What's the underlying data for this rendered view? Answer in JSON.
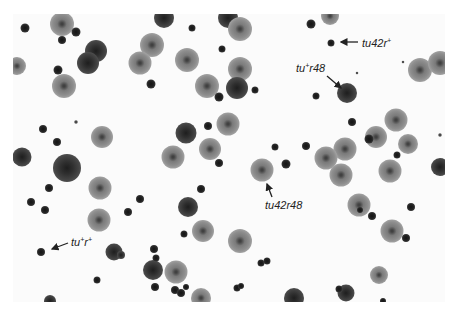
{
  "figure": {
    "labels": [
      {
        "id": "tu42r_plus",
        "base": "tu42r",
        "sup": "+",
        "tail": ""
      },
      {
        "id": "tu_plus_r48",
        "base": "tu",
        "sup": "+",
        "tail": "r48"
      },
      {
        "id": "tu42r48",
        "base": "tu42r48",
        "sup": "",
        "tail": ""
      },
      {
        "id": "tu_plus_r_plus",
        "base": "tu",
        "sup": "+",
        "tail": "r",
        "sup2": "+"
      }
    ]
  },
  "plaques": [
    {
      "x": 62,
      "y": 24,
      "d": 24,
      "t": "r"
    },
    {
      "x": 25,
      "y": 28,
      "d": 9,
      "t": "small"
    },
    {
      "x": 76,
      "y": 32,
      "d": 9,
      "t": "small"
    },
    {
      "x": 62,
      "y": 40,
      "d": 8,
      "t": "small"
    },
    {
      "x": 96,
      "y": 51,
      "d": 22,
      "t": "dark"
    },
    {
      "x": 88,
      "y": 63,
      "d": 22,
      "t": "dark"
    },
    {
      "x": 17,
      "y": 66,
      "d": 18,
      "t": "r"
    },
    {
      "x": 58,
      "y": 70,
      "d": 9,
      "t": "small"
    },
    {
      "x": 64,
      "y": 86,
      "d": 24,
      "t": "r"
    },
    {
      "x": 164,
      "y": 18,
      "d": 20,
      "t": "dark"
    },
    {
      "x": 192,
      "y": 28,
      "d": 7,
      "t": "small"
    },
    {
      "x": 228,
      "y": 18,
      "d": 20,
      "t": "dark"
    },
    {
      "x": 152,
      "y": 45,
      "d": 24,
      "t": "r"
    },
    {
      "x": 140,
      "y": 63,
      "d": 23,
      "t": "r"
    },
    {
      "x": 222,
      "y": 49,
      "d": 7,
      "t": "small"
    },
    {
      "x": 187,
      "y": 60,
      "d": 24,
      "t": "r"
    },
    {
      "x": 240,
      "y": 29,
      "d": 24,
      "t": "r"
    },
    {
      "x": 240,
      "y": 69,
      "d": 24,
      "t": "r"
    },
    {
      "x": 151,
      "y": 84,
      "d": 9,
      "t": "small"
    },
    {
      "x": 207,
      "y": 86,
      "d": 24,
      "t": "r"
    },
    {
      "x": 237,
      "y": 88,
      "d": 22,
      "t": "dark"
    },
    {
      "x": 219,
      "y": 97,
      "d": 9,
      "t": "small"
    },
    {
      "x": 255,
      "y": 90,
      "d": 7,
      "t": "small"
    },
    {
      "x": 311,
      "y": 24,
      "d": 9,
      "t": "small"
    },
    {
      "x": 330,
      "y": 16,
      "d": 18,
      "t": "r"
    },
    {
      "x": 331,
      "y": 43,
      "d": 7,
      "t": "small"
    },
    {
      "x": 347,
      "y": 93,
      "d": 20,
      "t": "dark"
    },
    {
      "x": 316,
      "y": 96,
      "d": 7,
      "t": "small"
    },
    {
      "x": 357,
      "y": 73,
      "d": 3,
      "t": "tiny"
    },
    {
      "x": 420,
      "y": 70,
      "d": 24,
      "t": "r"
    },
    {
      "x": 440,
      "y": 63,
      "d": 24,
      "t": "r"
    },
    {
      "x": 403,
      "y": 62,
      "d": 3,
      "t": "tiny"
    },
    {
      "x": 43,
      "y": 129,
      "d": 8,
      "t": "small"
    },
    {
      "x": 57,
      "y": 142,
      "d": 8,
      "t": "small"
    },
    {
      "x": 76,
      "y": 122,
      "d": 4,
      "t": "tiny"
    },
    {
      "x": 102,
      "y": 137,
      "d": 22,
      "t": "r"
    },
    {
      "x": 22,
      "y": 157,
      "d": 19,
      "t": "dark"
    },
    {
      "x": 67,
      "y": 168,
      "d": 28,
      "t": "dark"
    },
    {
      "x": 49,
      "y": 188,
      "d": 8,
      "t": "small"
    },
    {
      "x": 100,
      "y": 188,
      "d": 23,
      "t": "r"
    },
    {
      "x": 31,
      "y": 202,
      "d": 8,
      "t": "small"
    },
    {
      "x": 140,
      "y": 199,
      "d": 8,
      "t": "small"
    },
    {
      "x": 186,
      "y": 133,
      "d": 21,
      "t": "dark"
    },
    {
      "x": 208,
      "y": 126,
      "d": 8,
      "t": "small"
    },
    {
      "x": 228,
      "y": 124,
      "d": 23,
      "t": "r"
    },
    {
      "x": 210,
      "y": 149,
      "d": 22,
      "t": "r"
    },
    {
      "x": 173,
      "y": 157,
      "d": 23,
      "t": "r"
    },
    {
      "x": 219,
      "y": 163,
      "d": 8,
      "t": "small"
    },
    {
      "x": 262,
      "y": 170,
      "d": 23,
      "t": "r"
    },
    {
      "x": 275,
      "y": 147,
      "d": 7,
      "t": "small"
    },
    {
      "x": 286,
      "y": 164,
      "d": 9,
      "t": "small"
    },
    {
      "x": 306,
      "y": 146,
      "d": 8,
      "t": "small"
    },
    {
      "x": 201,
      "y": 189,
      "d": 8,
      "t": "small"
    },
    {
      "x": 188,
      "y": 207,
      "d": 20,
      "t": "dark"
    },
    {
      "x": 352,
      "y": 122,
      "d": 8,
      "t": "small"
    },
    {
      "x": 396,
      "y": 120,
      "d": 23,
      "t": "r"
    },
    {
      "x": 376,
      "y": 137,
      "d": 22,
      "t": "r"
    },
    {
      "x": 369,
      "y": 139,
      "d": 9,
      "t": "small"
    },
    {
      "x": 345,
      "y": 149,
      "d": 23,
      "t": "r"
    },
    {
      "x": 326,
      "y": 158,
      "d": 23,
      "t": "r"
    },
    {
      "x": 408,
      "y": 144,
      "d": 20,
      "t": "r"
    },
    {
      "x": 440,
      "y": 135,
      "d": 4,
      "t": "tiny"
    },
    {
      "x": 397,
      "y": 155,
      "d": 7,
      "t": "small"
    },
    {
      "x": 341,
      "y": 175,
      "d": 23,
      "t": "r"
    },
    {
      "x": 440,
      "y": 167,
      "d": 18,
      "t": "dark"
    },
    {
      "x": 390,
      "y": 171,
      "d": 23,
      "t": "r"
    },
    {
      "x": 359,
      "y": 205,
      "d": 23,
      "t": "r"
    },
    {
      "x": 411,
      "y": 207,
      "d": 8,
      "t": "small"
    },
    {
      "x": 360,
      "y": 210,
      "d": 6,
      "t": "small"
    },
    {
      "x": 372,
      "y": 216,
      "d": 8,
      "t": "small"
    },
    {
      "x": 392,
      "y": 231,
      "d": 23,
      "t": "r"
    },
    {
      "x": 406,
      "y": 238,
      "d": 8,
      "t": "small"
    },
    {
      "x": 45,
      "y": 210,
      "d": 8,
      "t": "small"
    },
    {
      "x": 99,
      "y": 220,
      "d": 23,
      "t": "r"
    },
    {
      "x": 128,
      "y": 212,
      "d": 8,
      "t": "small"
    },
    {
      "x": 41,
      "y": 252,
      "d": 8,
      "t": "small"
    },
    {
      "x": 114,
      "y": 252,
      "d": 17,
      "t": "dark"
    },
    {
      "x": 121,
      "y": 255,
      "d": 8,
      "t": "dark"
    },
    {
      "x": 154,
      "y": 249,
      "d": 8,
      "t": "small"
    },
    {
      "x": 153,
      "y": 270,
      "d": 20,
      "t": "dark"
    },
    {
      "x": 155,
      "y": 287,
      "d": 8,
      "t": "small"
    },
    {
      "x": 97,
      "y": 280,
      "d": 7,
      "t": "small"
    },
    {
      "x": 203,
      "y": 231,
      "d": 22,
      "t": "r"
    },
    {
      "x": 184,
      "y": 234,
      "d": 7,
      "t": "small"
    },
    {
      "x": 240,
      "y": 241,
      "d": 24,
      "t": "r"
    },
    {
      "x": 176,
      "y": 272,
      "d": 23,
      "t": "r"
    },
    {
      "x": 156,
      "y": 258,
      "d": 7,
      "t": "small"
    },
    {
      "x": 175,
      "y": 290,
      "d": 8,
      "t": "small"
    },
    {
      "x": 181,
      "y": 293,
      "d": 8,
      "t": "small"
    },
    {
      "x": 186,
      "y": 287,
      "d": 6,
      "t": "small"
    },
    {
      "x": 201,
      "y": 298,
      "d": 20,
      "t": "r"
    },
    {
      "x": 261,
      "y": 263,
      "d": 7,
      "t": "small"
    },
    {
      "x": 267,
      "y": 261,
      "d": 7,
      "t": "small"
    },
    {
      "x": 237,
      "y": 288,
      "d": 7,
      "t": "small"
    },
    {
      "x": 241,
      "y": 286,
      "d": 6,
      "t": "small"
    },
    {
      "x": 294,
      "y": 298,
      "d": 20,
      "t": "dark"
    },
    {
      "x": 346,
      "y": 293,
      "d": 17,
      "t": "dark"
    },
    {
      "x": 339,
      "y": 289,
      "d": 7,
      "t": "small"
    },
    {
      "x": 379,
      "y": 275,
      "d": 18,
      "t": "r"
    },
    {
      "x": 383,
      "y": 301,
      "d": 6,
      "t": "small"
    },
    {
      "x": 50,
      "y": 301,
      "d": 12,
      "t": "dark"
    }
  ],
  "arrows": [
    {
      "x1": 358,
      "y1": 42,
      "x2": 341,
      "y2": 42,
      "target": "tu42r_plus"
    },
    {
      "x1": 327,
      "y1": 76,
      "x2": 341,
      "y2": 88,
      "target": "tu_plus_r48"
    },
    {
      "x1": 272,
      "y1": 197,
      "x2": 267,
      "y2": 184,
      "target": "tu42r48"
    },
    {
      "x1": 68,
      "y1": 243,
      "x2": 52,
      "y2": 249,
      "target": "tu_plus_r_plus"
    }
  ]
}
